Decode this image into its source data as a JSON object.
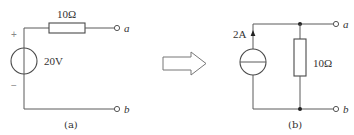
{
  "circuit_a": {
    "caption": "(a)",
    "resistor_label": "10Ω",
    "source_label": "20V",
    "source_type": "voltage-source",
    "plus_sign": "+",
    "minus_sign": "−",
    "terminal_top": "a",
    "terminal_bottom": "b"
  },
  "transform_arrow": {
    "icon": "hollow-right-arrow"
  },
  "circuit_b": {
    "caption": "(b)",
    "source_label": "2A",
    "source_type": "current-source",
    "resistor_label": "10Ω",
    "terminal_top": "a",
    "terminal_bottom": "b"
  },
  "colors": {
    "wire": "#5a5a5a",
    "node_dot": "#222222",
    "background": "#ffffff"
  }
}
